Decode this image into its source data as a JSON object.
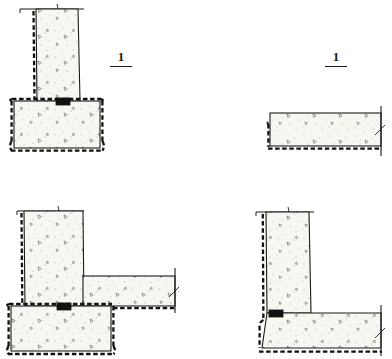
{
  "drawing": {
    "title": "Waterproofing construction details",
    "sheet_width": 392,
    "sheet_height": 359,
    "background_color": "#ffffff",
    "line_color": "#1a1a1a",
    "concrete_fill_color": "#f7f7f2",
    "membrane_color": "#111111",
    "waterstop_color": "#111111",
    "scale_note": ""
  },
  "panels": [
    {
      "id": "detail-1-wall-footing",
      "label": "1",
      "position": "top-left",
      "label_x": 120,
      "label_y": 55,
      "description": "Concrete wall stem on spread footing with waterproofing membrane wrapping outer face and footing, waterstop at base joint",
      "elements": [
        {
          "name": "grade-line",
          "type": "line"
        },
        {
          "name": "wall-stem",
          "type": "concrete-section"
        },
        {
          "name": "spread-footing",
          "type": "concrete-section"
        },
        {
          "name": "waterproof-membrane",
          "type": "dashed-membrane"
        },
        {
          "name": "waterstop",
          "type": "filled-block"
        }
      ]
    },
    {
      "id": "detail-1-slab",
      "label": "1",
      "position": "top-right",
      "label_x": 325,
      "label_y": 55,
      "description": "Concrete floor slab with waterproofing membrane beneath and short turn-up at left edge",
      "elements": [
        {
          "name": "floor-slab",
          "type": "concrete-section"
        },
        {
          "name": "waterproof-membrane",
          "type": "dashed-membrane"
        },
        {
          "name": "break-line",
          "type": "line"
        }
      ]
    },
    {
      "id": "detail-2-wall-footing-slab",
      "label": "2",
      "position": "bottom-left",
      "label_x": 120,
      "label_y": 232,
      "description": "Concrete wall stem on spread footing with adjoining floor slab, membrane wrapping outer wall face and footing and continuing under slab, waterstop at base joint",
      "elements": [
        {
          "name": "grade-line",
          "type": "line"
        },
        {
          "name": "wall-stem",
          "type": "concrete-section"
        },
        {
          "name": "spread-footing",
          "type": "concrete-section"
        },
        {
          "name": "floor-slab",
          "type": "concrete-section"
        },
        {
          "name": "waterproof-membrane",
          "type": "dashed-membrane"
        },
        {
          "name": "waterstop",
          "type": "filled-block"
        },
        {
          "name": "break-line",
          "type": "line"
        }
      ]
    },
    {
      "id": "detail-2-wall-slab",
      "label": "2",
      "position": "bottom-right",
      "label_x": 327,
      "label_y": 232,
      "description": "Concrete wall stem with thickened floor slab, membrane wrapping outer wall face turning under slab, waterstop at base joint",
      "elements": [
        {
          "name": "grade-line",
          "type": "line"
        },
        {
          "name": "wall-stem",
          "type": "concrete-section"
        },
        {
          "name": "floor-slab",
          "type": "concrete-section"
        },
        {
          "name": "waterproof-membrane",
          "type": "dashed-membrane"
        },
        {
          "name": "waterstop",
          "type": "filled-block"
        },
        {
          "name": "break-line",
          "type": "line"
        }
      ]
    }
  ]
}
